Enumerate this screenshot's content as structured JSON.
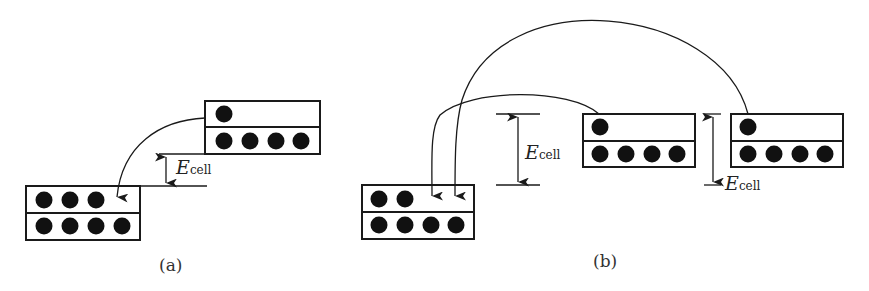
{
  "diagram": {
    "colors": {
      "stroke": "#1a1a1a",
      "electron": "#111111",
      "background": "#ffffff"
    },
    "energy_label": {
      "symbol": "E",
      "subscript": "cell"
    },
    "panels": [
      {
        "id": "a",
        "caption": "(a)",
        "boxes": [
          {
            "name": "upper-electrode",
            "upper_row_electrons": 1,
            "lower_row_electrons": 4
          },
          {
            "name": "lower-electrode",
            "upper_row_electrons": 3,
            "lower_row_electrons": 4
          }
        ],
        "transitions": [
          {
            "from": "upper-electrode",
            "to": "lower-electrode"
          }
        ],
        "energy_gaps": 1
      },
      {
        "id": "b",
        "caption": "(b)",
        "boxes": [
          {
            "name": "lower-electrode",
            "upper_row_electrons": 2,
            "lower_row_electrons": 4
          },
          {
            "name": "upper-electrode-1",
            "upper_row_electrons": 1,
            "lower_row_electrons": 4
          },
          {
            "name": "upper-electrode-2",
            "upper_row_electrons": 1,
            "lower_row_electrons": 4
          }
        ],
        "transitions": [
          {
            "from": "upper-electrode-1",
            "to": "lower-electrode"
          },
          {
            "from": "upper-electrode-2",
            "to": "lower-electrode"
          }
        ],
        "energy_gaps": 2
      }
    ]
  }
}
